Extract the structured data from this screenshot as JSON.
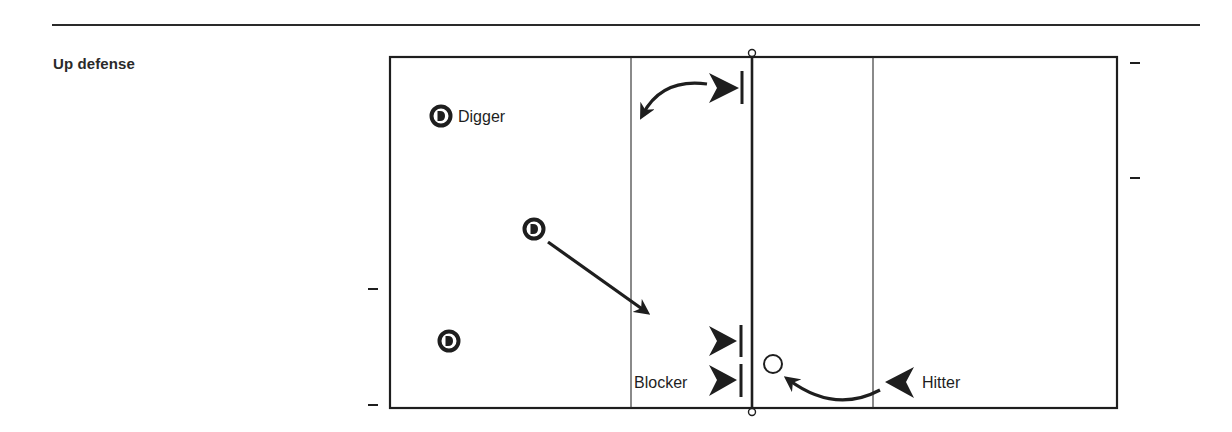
{
  "section": {
    "title": "Up defense"
  },
  "diagram": {
    "type": "volleyball-court",
    "labels": {
      "digger": "Digger",
      "blocker": "Blocker",
      "hitter": "Hitter"
    },
    "players": [
      {
        "role": "defender",
        "symbol": "D",
        "label": "Digger"
      },
      {
        "role": "defender",
        "symbol": "D",
        "label": ""
      },
      {
        "role": "defender",
        "symbol": "D",
        "label": ""
      },
      {
        "role": "blocker",
        "symbol": "triangle-bar",
        "label": ""
      },
      {
        "role": "blocker",
        "symbol": "triangle-bar",
        "label": ""
      },
      {
        "role": "blocker",
        "symbol": "triangle-bar",
        "label": "Blocker"
      },
      {
        "role": "hitter",
        "symbol": "triangle",
        "label": "Hitter"
      }
    ],
    "colors": {
      "ink": "#1e1e1e",
      "background": "#ffffff"
    }
  }
}
